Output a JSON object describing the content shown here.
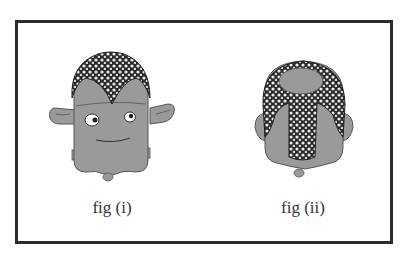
{
  "figures": [
    {
      "id": "fig-i",
      "caption": "fig (i)",
      "view": "front",
      "description": "Creature front view with curly mohawk-style hair, two eyes, smile, and side ears"
    },
    {
      "id": "fig-ii",
      "caption": "fig (ii)",
      "view": "back",
      "description": "Creature back view showing bald crown and curly braid-like hair down the back"
    }
  ],
  "colors": {
    "frame_border": "#2b2b2b",
    "skin": "#9a9a9a",
    "outline": "#555555",
    "hair_dark": "#2a2a2a",
    "hair_light": "#e8e8e8",
    "background": "#ffffff"
  }
}
